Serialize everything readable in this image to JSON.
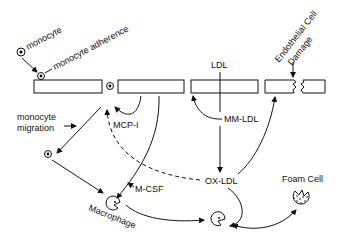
{
  "diagram": {
    "labels": {
      "monocyte": "monocyte",
      "monocyte_adherence": "monocyte adherence",
      "monocyte_migration_1": "monocyte",
      "monocyte_migration_2": "migration",
      "mcp1": "MCP-I",
      "m_csf": "M-CSF",
      "macrophage": "Macrophage",
      "ldl": "LDL",
      "mm_ldl": "MM-LDL",
      "ox_ldl": "OX-LDL",
      "endothelial_1": "Endothelial Cell",
      "endothelial_2": "Damage",
      "foam_cell": "Foam Cell"
    },
    "nodes": [
      "monocyte",
      "adherent monocyte",
      "endothelium",
      "migrated monocyte",
      "macrophage",
      "LDL",
      "MM-LDL",
      "OX-LDL",
      "OX-LDL-laden macrophage",
      "Foam Cell"
    ],
    "edges": [
      {
        "from": "monocyte",
        "to": "adherent monocyte",
        "style": "solid"
      },
      {
        "from": "endothelium",
        "to": "migrated monocyte",
        "style": "solid",
        "label": "monocyte migration"
      },
      {
        "from": "endothelium",
        "to": "endothelium",
        "style": "solid",
        "label": "MCP-I"
      },
      {
        "from": "MM-LDL",
        "to": "endothelium",
        "style": "solid"
      },
      {
        "from": "LDL",
        "to": "OX-LDL",
        "style": "solid",
        "via": "MM-LDL"
      },
      {
        "from": "OX-LDL",
        "to": "MCP-I",
        "style": "dashed"
      },
      {
        "from": "endothelium",
        "to": "macrophage",
        "style": "solid",
        "label": "M-CSF"
      },
      {
        "from": "migrated monocyte",
        "to": "macrophage",
        "style": "solid"
      },
      {
        "from": "macrophage",
        "to": "OX-LDL-laden macrophage",
        "style": "solid"
      },
      {
        "from": "OX-LDL",
        "to": "OX-LDL-laden macrophage",
        "style": "solid"
      },
      {
        "from": "OX-LDL",
        "to": "endothelium",
        "style": "solid",
        "label": "Endothelial Cell Damage"
      },
      {
        "from": "OX-LDL-laden macrophage",
        "to": "Foam Cell",
        "style": "solid",
        "bidirectional": true
      }
    ]
  }
}
